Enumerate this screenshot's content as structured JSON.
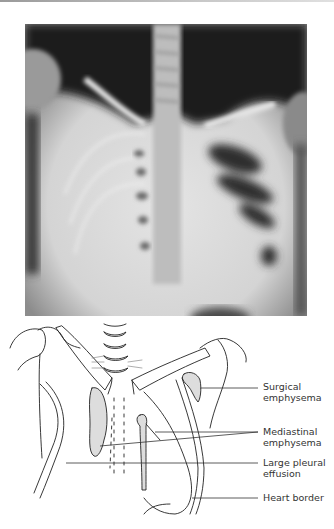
{
  "figure": {
    "xray_alt": "Chest X-ray showing surgical and mediastinal emphysema with large pleural effusion",
    "diagram_alt": "Line drawing of chest X-ray with labelled features",
    "labels": [
      {
        "id": "surgical",
        "line1": "Surgical",
        "line2": "emphysema"
      },
      {
        "id": "mediastinal",
        "line1": "Mediastinal",
        "line2": "emphysema"
      },
      {
        "id": "pleural",
        "line1": "Large pleural",
        "line2": "effusion"
      },
      {
        "id": "heart",
        "line1": "Heart border",
        "line2": ""
      }
    ]
  }
}
